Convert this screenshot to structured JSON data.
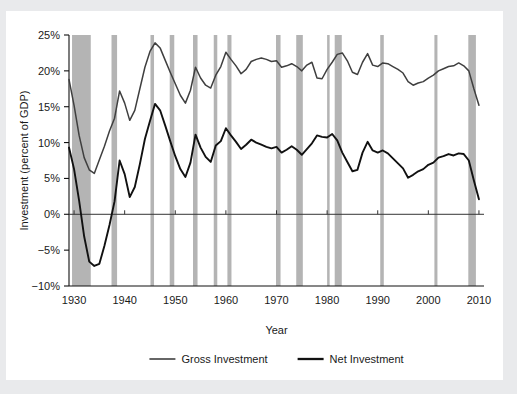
{
  "figure": {
    "background_color": "#ffffff",
    "page_color": "#e9eaec",
    "recession_band_color": "#b4b4b4",
    "gross_line_color": "#3f3f3f",
    "net_line_color": "#111111"
  },
  "axes": {
    "y_axis_title": "Investment (percent of GDP)",
    "x_axis_title": "Year",
    "y_ticks": [
      "25%",
      "20%",
      "15%",
      "10%",
      "5%",
      "0%",
      "−5%",
      "−10%"
    ],
    "y_tick_values": [
      25,
      20,
      15,
      10,
      5,
      0,
      -5,
      -10
    ],
    "x_ticks": [
      "1930",
      "1940",
      "1950",
      "1960",
      "1970",
      "1980",
      "1990",
      "2000",
      "2010"
    ],
    "x_tick_values": [
      1930,
      1940,
      1950,
      1960,
      1970,
      1980,
      1990,
      2000,
      2010
    ]
  },
  "legend": {
    "position": "below-plot",
    "entries": [
      {
        "label": "Gross Investment",
        "color": "#3f3f3f"
      },
      {
        "label": "Net Investment",
        "color": "#111111"
      }
    ]
  },
  "chart_data": {
    "type": "line",
    "title": "",
    "xlabel": "Year",
    "ylabel": "Investment (percent of GDP)",
    "xlim": [
      1929,
      2011
    ],
    "ylim": [
      -10,
      25
    ],
    "grid": false,
    "legend_position": "below-plot",
    "x": [
      1929,
      1930,
      1931,
      1932,
      1933,
      1934,
      1935,
      1936,
      1937,
      1938,
      1939,
      1940,
      1941,
      1942,
      1943,
      1944,
      1945,
      1946,
      1947,
      1948,
      1949,
      1950,
      1951,
      1952,
      1953,
      1954,
      1955,
      1956,
      1957,
      1958,
      1959,
      1960,
      1961,
      1962,
      1963,
      1964,
      1965,
      1966,
      1967,
      1968,
      1969,
      1970,
      1971,
      1972,
      1973,
      1974,
      1975,
      1976,
      1977,
      1978,
      1979,
      1980,
      1981,
      1982,
      1983,
      1984,
      1985,
      1986,
      1987,
      1988,
      1989,
      1990,
      1991,
      1992,
      1993,
      1994,
      1995,
      1996,
      1997,
      1998,
      1999,
      2000,
      2001,
      2002,
      2003,
      2004,
      2005,
      2006,
      2007,
      2008,
      2009,
      2010
    ],
    "series": [
      {
        "name": "Gross Investment",
        "color": "#3f3f3f",
        "values": [
          18.8,
          15.2,
          11.0,
          7.9,
          6.2,
          5.7,
          7.6,
          9.5,
          11.6,
          13.4,
          17.2,
          15.5,
          13.1,
          14.5,
          17.5,
          20.5,
          22.7,
          23.9,
          23.2,
          21.5,
          19.8,
          18.2,
          16.6,
          15.5,
          17.3,
          20.5,
          19.0,
          18.0,
          17.6,
          19.4,
          20.6,
          22.6,
          21.6,
          20.7,
          19.6,
          20.2,
          21.3,
          21.6,
          21.8,
          21.6,
          21.3,
          21.4,
          20.5,
          20.7,
          21.0,
          20.6,
          20.0,
          20.8,
          21.2,
          19.0,
          18.9,
          20.2,
          21.2,
          22.3,
          22.5,
          21.4,
          19.8,
          19.5,
          21.2,
          22.4,
          20.8,
          20.6,
          21.1,
          21.0,
          20.6,
          20.2,
          19.7,
          18.5,
          18.0,
          18.3,
          18.5,
          19.0,
          19.4,
          20.0,
          20.3,
          20.6,
          20.7,
          21.1,
          20.7,
          20.0,
          17.5,
          15.2
        ]
      },
      {
        "name": "Net Investment",
        "color": "#111111",
        "values": [
          9.3,
          6.3,
          1.9,
          -3.1,
          -6.6,
          -7.2,
          -6.9,
          -4.4,
          -1.5,
          1.8,
          7.5,
          5.6,
          2.4,
          3.8,
          7.0,
          10.5,
          13.0,
          15.4,
          14.5,
          12.4,
          10.2,
          8.1,
          6.3,
          5.2,
          7.2,
          11.1,
          9.3,
          8.0,
          7.3,
          9.6,
          10.2,
          12.0,
          11.0,
          10.1,
          9.1,
          9.7,
          10.4,
          10.0,
          9.7,
          9.4,
          9.2,
          9.4,
          8.6,
          9.0,
          9.5,
          9.0,
          8.3,
          9.1,
          9.9,
          11.0,
          10.8,
          10.7,
          11.2,
          10.3,
          8.6,
          7.3,
          6.0,
          6.2,
          8.6,
          10.1,
          8.9,
          8.6,
          8.9,
          8.5,
          7.8,
          7.1,
          6.4,
          5.1,
          5.5,
          6.0,
          6.3,
          6.9,
          7.2,
          7.9,
          8.1,
          8.4,
          8.2,
          8.5,
          8.4,
          7.5,
          4.7,
          2.1
        ]
      }
    ],
    "recession_bands": [
      {
        "start": 1929.6,
        "end": 1933.3
      },
      {
        "start": 1937.4,
        "end": 1938.5
      },
      {
        "start": 1945.1,
        "end": 1945.8
      },
      {
        "start": 1948.9,
        "end": 1949.8
      },
      {
        "start": 1953.5,
        "end": 1954.4
      },
      {
        "start": 1957.6,
        "end": 1958.3
      },
      {
        "start": 1960.3,
        "end": 1961.1
      },
      {
        "start": 1969.9,
        "end": 1970.8
      },
      {
        "start": 1973.9,
        "end": 1975.2
      },
      {
        "start": 1980.0,
        "end": 1980.5
      },
      {
        "start": 1981.5,
        "end": 1982.9
      },
      {
        "start": 1990.5,
        "end": 1991.2
      },
      {
        "start": 2001.2,
        "end": 2001.8
      },
      {
        "start": 2007.9,
        "end": 2009.4
      }
    ]
  }
}
